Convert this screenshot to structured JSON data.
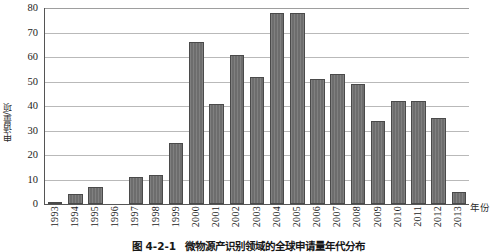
{
  "figure": {
    "caption_number": "图 4-2-1",
    "caption_text": "微物源产识别领域的全球申请量年代分布"
  },
  "chart_data": {
    "type": "bar",
    "title": "",
    "xlabel": "年份",
    "ylabel": "申请量/项",
    "ylim": [
      0,
      80
    ],
    "ytick_values": [
      0,
      10,
      20,
      30,
      40,
      50,
      60,
      70,
      80
    ],
    "ytick_labels": [
      "0",
      "10",
      "20",
      "30",
      "40",
      "50",
      "60",
      "70",
      "80"
    ],
    "grid": true,
    "legend": false,
    "bar_color": "#6d6d6d",
    "bar_edge_color": "#4a4a4a",
    "categories": [
      "1993",
      "1994",
      "1995",
      "1996",
      "1997",
      "1998",
      "1999",
      "2000",
      "2001",
      "2002",
      "2003",
      "2004",
      "2005",
      "2006",
      "2007",
      "2008",
      "2009",
      "2010",
      "2011",
      "2012",
      "2013"
    ],
    "values": [
      1,
      4,
      7,
      0,
      11,
      12,
      25,
      66,
      41,
      61,
      52,
      78,
      78,
      51,
      53,
      49,
      34,
      42,
      42,
      35,
      5
    ]
  }
}
